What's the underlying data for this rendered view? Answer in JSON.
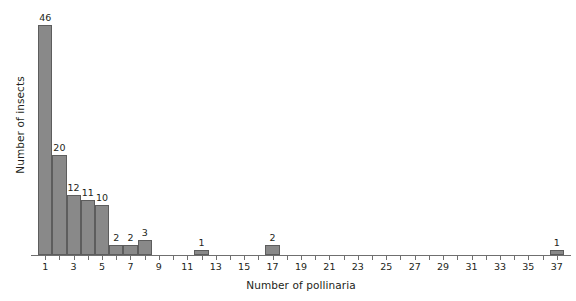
{
  "chart_data": {
    "type": "bar",
    "title": "",
    "xlabel": "Number of pollinaria",
    "ylabel": "Number of insects",
    "categories": [
      1,
      2,
      3,
      4,
      5,
      6,
      7,
      8,
      12,
      17,
      37
    ],
    "values": [
      46,
      20,
      12,
      11,
      10,
      2,
      2,
      3,
      1,
      2,
      1
    ],
    "bar_labels": [
      "46",
      "20",
      "12",
      "11",
      "10",
      "2",
      "2",
      "3",
      "1",
      "2",
      "1"
    ],
    "xlim": [
      0,
      38
    ],
    "ylim": [
      0,
      46
    ],
    "xticks": [
      1,
      2,
      3,
      4,
      5,
      6,
      7,
      8,
      9,
      10,
      11,
      12,
      13,
      14,
      15,
      16,
      17,
      18,
      19,
      20,
      21,
      22,
      23,
      24,
      25,
      26,
      27,
      28,
      29,
      30,
      31,
      32,
      33,
      34,
      35,
      36,
      37
    ],
    "xtick_labels_shown": [
      "1",
      "3",
      "5",
      "7",
      "9",
      "11",
      "13",
      "15",
      "17",
      "19",
      "21",
      "23",
      "25",
      "27",
      "29",
      "31",
      "33",
      "35",
      "37"
    ],
    "grid": false,
    "legend": null,
    "bar_fill_color": "#898989",
    "bar_stroke_color": "#5d5d5d",
    "axis_color": "#6f6f6f",
    "text_color": "#231f20"
  }
}
